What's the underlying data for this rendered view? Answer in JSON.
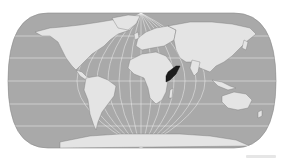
{
  "map": {
    "projection": "pseudo-cylindrical world map",
    "ocean_color": "#a9a9a9",
    "land_color": "#e4e4e4",
    "graticule_color": "#f2f2f2",
    "highlight_color": "#1c1c1c",
    "highlighted_region": "Somalia",
    "border_color": "#7a7a7a"
  }
}
